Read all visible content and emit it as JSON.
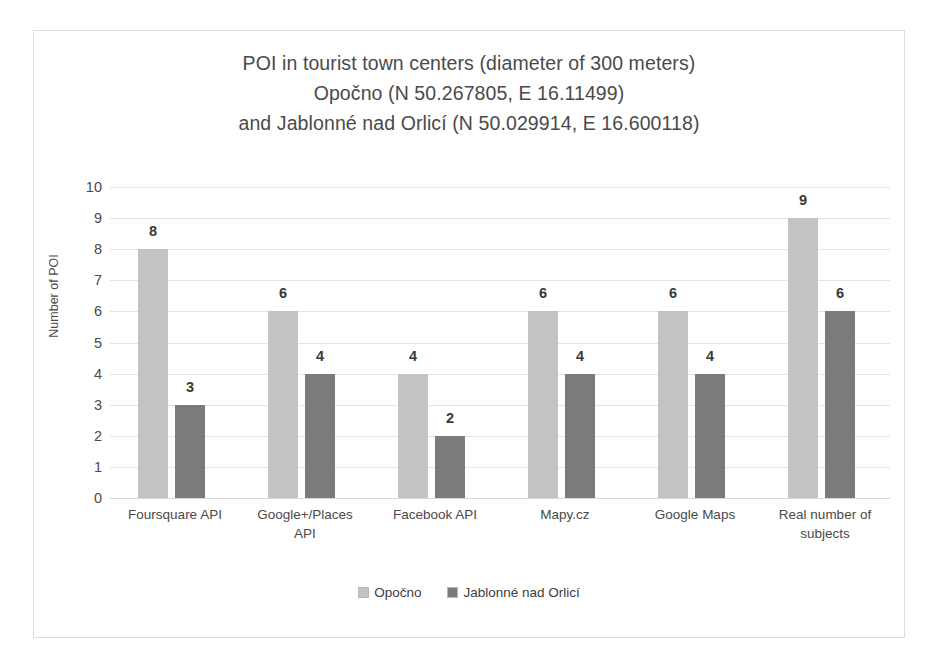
{
  "chart_data": {
    "type": "bar",
    "title": "POI in tourist town centers (diameter of 300 meters) Opočno (N 50.267805, E 16.11499) and Jablonné nad Orlicí (N 50.029914, E 16.600118)",
    "title_lines": [
      "POI in tourist town centers (diameter of 300 meters)",
      "Opočno (N 50.267805, E 16.11499)",
      "and Jablonné nad Orlicí (N 50.029914, E 16.600118)"
    ],
    "xlabel": "",
    "ylabel": "Number of POI",
    "ylim": [
      0,
      10
    ],
    "ytick_step": 1,
    "yticks": [
      "10",
      "9",
      "8",
      "7",
      "6",
      "5",
      "4",
      "3",
      "2",
      "1",
      "0"
    ],
    "grid": true,
    "legend_position": "bottom",
    "categories": [
      "Foursquare API",
      "Google+/Places API",
      "Facebook API",
      "Mapy.cz",
      "Google Maps",
      "Real number of subjects"
    ],
    "category_lines": [
      [
        "Foursquare API"
      ],
      [
        "Google+/Places",
        "API"
      ],
      [
        "Facebook API"
      ],
      [
        "Mapy.cz"
      ],
      [
        "Google Maps"
      ],
      [
        "Real number of",
        "subjects"
      ]
    ],
    "series": [
      {
        "name": "Opočno",
        "color": "#c3c3c3",
        "values": [
          8,
          6,
          4,
          6,
          6,
          9
        ]
      },
      {
        "name": "Jablonné nad Orlicí",
        "color": "#7b7b7b",
        "values": [
          3,
          4,
          2,
          4,
          4,
          6
        ]
      }
    ]
  },
  "colors": {
    "series_light": "#c3c3c3",
    "series_dark": "#7b7b7b",
    "gridline": "#e4e4e4",
    "border": "#dcdcdc",
    "text": "#4a4a4a",
    "value_label": "#383838"
  }
}
